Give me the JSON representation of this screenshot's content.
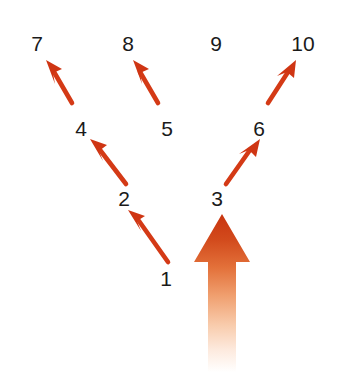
{
  "diagram": {
    "background_color": "#ffffff",
    "canvas": {
      "width": 340,
      "height": 372
    },
    "arrow_color": "#d43a16",
    "arrow_color_dark": "#c42f10",
    "gradient_arrow": {
      "name": "main-upward-arrow",
      "color_top": "#c8340f",
      "color_mid": "#e8793c",
      "color_bottom": "#ffffff",
      "direction": "up",
      "points_to": "3"
    },
    "nodes": [
      {
        "id": "1",
        "label": "1",
        "x": 166,
        "y": 268
      },
      {
        "id": "2",
        "label": "2",
        "x": 124,
        "y": 188
      },
      {
        "id": "3",
        "label": "3",
        "x": 217,
        "y": 188
      },
      {
        "id": "4",
        "label": "4",
        "x": 81,
        "y": 118
      },
      {
        "id": "5",
        "label": "5",
        "x": 167,
        "y": 118
      },
      {
        "id": "6",
        "label": "6",
        "x": 259,
        "y": 118
      },
      {
        "id": "7",
        "label": "7",
        "x": 37,
        "y": 33
      },
      {
        "id": "8",
        "label": "8",
        "x": 128,
        "y": 33
      },
      {
        "id": "9",
        "label": "9",
        "x": 216,
        "y": 33
      },
      {
        "id": "10",
        "label": "10",
        "x": 303,
        "y": 33
      }
    ],
    "connections": [
      {
        "name": "arrow-1-to-2",
        "from": "1",
        "to": "2",
        "x1": 168,
        "y1": 262,
        "x2": 133,
        "y2": 213
      },
      {
        "name": "arrow-2-to-4",
        "from": "2",
        "to": "4",
        "x1": 124,
        "y1": 185,
        "x2": 90,
        "y2": 142
      },
      {
        "name": "arrow-3-to-6",
        "from": "3",
        "to": "6",
        "x1": 224,
        "y1": 186,
        "x2": 254,
        "y2": 142
      },
      {
        "name": "arrow-5-to-8",
        "from": "5",
        "to": "8",
        "x1": 158,
        "y1": 110,
        "x2": 130,
        "y2": 60
      },
      {
        "name": "arrow-6-to-10",
        "from": "6",
        "to": "10",
        "x1": 268,
        "y1": 110,
        "x2": 300,
        "y2": 60
      },
      {
        "name": "arrow-4-to-7",
        "from": "4",
        "to": "7",
        "x1": 72,
        "y1": 110,
        "x2": 45,
        "y2": 60
      }
    ]
  }
}
